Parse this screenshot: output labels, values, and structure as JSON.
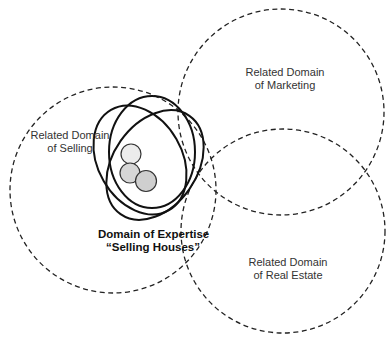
{
  "diagram": {
    "domains": [
      {
        "id": "selling",
        "line1": "Related Domain",
        "line2": "of Selling"
      },
      {
        "id": "marketing",
        "line1": "Related Domain",
        "line2": "of Marketing"
      },
      {
        "id": "real_estate",
        "line1": "Related Domain",
        "line2": "of Real Estate"
      }
    ],
    "expertise": {
      "line1": "Domain of Expertise",
      "line2": "“Selling Houses”"
    },
    "colors": {
      "dashed": "#222222",
      "solid": "#111111",
      "node_light": "#e6e6e6",
      "node_mid": "#cfcfcf"
    }
  }
}
